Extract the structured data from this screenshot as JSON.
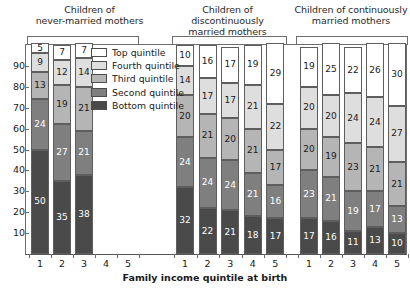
{
  "chart_data": {
    "type": "bar",
    "subtype": "stacked-bar-100",
    "title": "",
    "xlabel": "Family income quintile at birth",
    "ylabel": "",
    "ylim": [
      0,
      100
    ],
    "ytick_labels": [
      "90",
      "80",
      "70",
      "60",
      "50",
      "40",
      "30",
      "20",
      "10"
    ],
    "ytick_values": [
      90,
      80,
      70,
      60,
      50,
      40,
      30,
      20,
      10
    ],
    "grid": false,
    "legend_position": "inside-upper-left",
    "categories": [
      "1",
      "2",
      "3",
      "4",
      "5"
    ],
    "series": [
      {
        "name": "Bottom quintile",
        "color": "#4a4a4a",
        "label_color": "#ffffff"
      },
      {
        "name": "Second quintile",
        "color": "#7f7f7f",
        "label_color": "#ffffff"
      },
      {
        "name": "Third quintile",
        "color": "#b5b5b5",
        "label_color": "#1a1a1a"
      },
      {
        "name": "Fourth quintile",
        "color": "#dedede",
        "label_color": "#1a1a1a"
      },
      {
        "name": "Top quintile",
        "color": "#ffffff",
        "label_color": "#1a1a1a"
      }
    ],
    "groups": [
      {
        "title_line1": "Children of",
        "title_line2": "never-married mothers",
        "present_categories": [
          "1",
          "2",
          "3"
        ],
        "bars": [
          {
            "category": "1",
            "bottom": 50,
            "second": 24,
            "third": 13,
            "fourth": 9,
            "top": 5
          },
          {
            "category": "2",
            "bottom": 35,
            "second": 27,
            "third": 19,
            "fourth": 12,
            "top": 7
          },
          {
            "category": "3",
            "bottom": 38,
            "second": 21,
            "third": 21,
            "fourth": 14,
            "top": 7
          }
        ]
      },
      {
        "title_line1": "Children of discontinuously",
        "title_line2": "married mothers",
        "present_categories": [
          "1",
          "2",
          "3",
          "4",
          "5"
        ],
        "bars": [
          {
            "category": "1",
            "bottom": 32,
            "second": 24,
            "third": 20,
            "fourth": 14,
            "top": 10
          },
          {
            "category": "2",
            "bottom": 22,
            "second": 24,
            "third": 21,
            "fourth": 17,
            "top": 16
          },
          {
            "category": "3",
            "bottom": 21,
            "second": 24,
            "third": 20,
            "fourth": 17,
            "top": 17
          },
          {
            "category": "4",
            "bottom": 18,
            "second": 21,
            "third": 21,
            "fourth": 21,
            "top": 19
          },
          {
            "category": "5",
            "bottom": 17,
            "second": 16,
            "third": 17,
            "fourth": 22,
            "top": 29
          }
        ]
      },
      {
        "title_line1": "Children of continuously",
        "title_line2": "married mothers",
        "present_categories": [
          "1",
          "2",
          "3",
          "4",
          "5"
        ],
        "bars": [
          {
            "category": "1",
            "bottom": 17,
            "second": 23,
            "third": 20,
            "fourth": 20,
            "top": 19
          },
          {
            "category": "2",
            "bottom": 16,
            "second": 21,
            "third": 19,
            "fourth": 20,
            "top": 25
          },
          {
            "category": "3",
            "bottom": 11,
            "second": 19,
            "third": 23,
            "fourth": 24,
            "top": 22
          },
          {
            "category": "4",
            "bottom": 13,
            "second": 17,
            "third": 21,
            "fourth": 24,
            "top": 26
          },
          {
            "category": "5",
            "bottom": 10,
            "second": 13,
            "third": 21,
            "fourth": 27,
            "top": 30
          }
        ]
      }
    ],
    "legend_entries": [
      {
        "label": "Top quintile",
        "color": "#ffffff"
      },
      {
        "label": "Fourth quintile",
        "color": "#dedede"
      },
      {
        "label": "Third quintile",
        "color": "#b5b5b5"
      },
      {
        "label": "Second quintile",
        "color": "#7f7f7f"
      },
      {
        "label": "Bottom quintile",
        "color": "#4a4a4a"
      }
    ]
  }
}
